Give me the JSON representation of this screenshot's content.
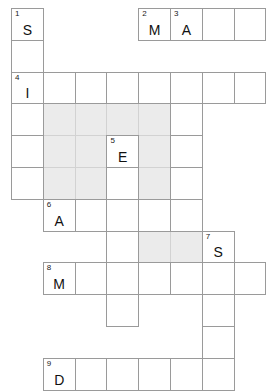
{
  "puzzle": {
    "title": "Crossword Puzzle Grid",
    "type": "crossword",
    "columns": 8,
    "rows": 12,
    "cell_size": 31.8,
    "origin_x": 11,
    "origin_y": 8,
    "colors": {
      "background": "#ffffff",
      "cell_fill": "#ffffff",
      "cell_border": "#9a9a9a",
      "shaded_fill": "#ebebeb",
      "shaded_border": "#d2d2d2",
      "number_text": "#1a1a1a",
      "letter_text": "#111111"
    },
    "cells": [
      {
        "row": 0,
        "col": 0,
        "number": "1",
        "letter": "S",
        "shaded": false
      },
      {
        "row": 0,
        "col": 4,
        "number": "2",
        "letter": "M",
        "shaded": false
      },
      {
        "row": 0,
        "col": 5,
        "number": "3",
        "letter": "A",
        "shaded": false
      },
      {
        "row": 0,
        "col": 6,
        "number": "",
        "letter": "",
        "shaded": false
      },
      {
        "row": 0,
        "col": 7,
        "number": "",
        "letter": "",
        "shaded": false
      },
      {
        "row": 1,
        "col": 0,
        "number": "",
        "letter": "",
        "shaded": false
      },
      {
        "row": 2,
        "col": 0,
        "number": "4",
        "letter": "I",
        "shaded": false
      },
      {
        "row": 2,
        "col": 1,
        "number": "",
        "letter": "",
        "shaded": false
      },
      {
        "row": 2,
        "col": 2,
        "number": "",
        "letter": "",
        "shaded": false
      },
      {
        "row": 2,
        "col": 3,
        "number": "",
        "letter": "",
        "shaded": false
      },
      {
        "row": 2,
        "col": 4,
        "number": "",
        "letter": "",
        "shaded": false
      },
      {
        "row": 2,
        "col": 5,
        "number": "",
        "letter": "",
        "shaded": false
      },
      {
        "row": 2,
        "col": 6,
        "number": "",
        "letter": "",
        "shaded": false
      },
      {
        "row": 2,
        "col": 7,
        "number": "",
        "letter": "",
        "shaded": false
      },
      {
        "row": 3,
        "col": 0,
        "number": "",
        "letter": "",
        "shaded": false
      },
      {
        "row": 3,
        "col": 1,
        "number": "",
        "letter": "",
        "shaded": true
      },
      {
        "row": 3,
        "col": 2,
        "number": "",
        "letter": "",
        "shaded": true
      },
      {
        "row": 3,
        "col": 3,
        "number": "",
        "letter": "",
        "shaded": true
      },
      {
        "row": 3,
        "col": 4,
        "number": "",
        "letter": "",
        "shaded": true
      },
      {
        "row": 3,
        "col": 5,
        "number": "",
        "letter": "",
        "shaded": false
      },
      {
        "row": 4,
        "col": 0,
        "number": "",
        "letter": "",
        "shaded": false
      },
      {
        "row": 4,
        "col": 1,
        "number": "",
        "letter": "",
        "shaded": true
      },
      {
        "row": 4,
        "col": 2,
        "number": "",
        "letter": "",
        "shaded": true
      },
      {
        "row": 4,
        "col": 3,
        "number": "5",
        "letter": "E",
        "shaded": false
      },
      {
        "row": 4,
        "col": 4,
        "number": "",
        "letter": "",
        "shaded": true
      },
      {
        "row": 4,
        "col": 5,
        "number": "",
        "letter": "",
        "shaded": false
      },
      {
        "row": 5,
        "col": 0,
        "number": "",
        "letter": "",
        "shaded": false
      },
      {
        "row": 5,
        "col": 1,
        "number": "",
        "letter": "",
        "shaded": true
      },
      {
        "row": 5,
        "col": 2,
        "number": "",
        "letter": "",
        "shaded": true
      },
      {
        "row": 5,
        "col": 3,
        "number": "",
        "letter": "",
        "shaded": false
      },
      {
        "row": 5,
        "col": 4,
        "number": "",
        "letter": "",
        "shaded": true
      },
      {
        "row": 5,
        "col": 5,
        "number": "",
        "letter": "",
        "shaded": false
      },
      {
        "row": 6,
        "col": 1,
        "number": "6",
        "letter": "A",
        "shaded": false
      },
      {
        "row": 6,
        "col": 2,
        "number": "",
        "letter": "",
        "shaded": false
      },
      {
        "row": 6,
        "col": 3,
        "number": "",
        "letter": "",
        "shaded": false
      },
      {
        "row": 6,
        "col": 4,
        "number": "",
        "letter": "",
        "shaded": false
      },
      {
        "row": 6,
        "col": 5,
        "number": "",
        "letter": "",
        "shaded": false
      },
      {
        "row": 7,
        "col": 3,
        "number": "",
        "letter": "",
        "shaded": false
      },
      {
        "row": 7,
        "col": 4,
        "number": "",
        "letter": "",
        "shaded": true
      },
      {
        "row": 7,
        "col": 5,
        "number": "",
        "letter": "",
        "shaded": true
      },
      {
        "row": 7,
        "col": 6,
        "number": "7",
        "letter": "S",
        "shaded": false
      },
      {
        "row": 8,
        "col": 1,
        "number": "8",
        "letter": "M",
        "shaded": false
      },
      {
        "row": 8,
        "col": 2,
        "number": "",
        "letter": "",
        "shaded": false
      },
      {
        "row": 8,
        "col": 3,
        "number": "",
        "letter": "",
        "shaded": false
      },
      {
        "row": 8,
        "col": 4,
        "number": "",
        "letter": "",
        "shaded": false
      },
      {
        "row": 8,
        "col": 5,
        "number": "",
        "letter": "",
        "shaded": false
      },
      {
        "row": 8,
        "col": 6,
        "number": "",
        "letter": "",
        "shaded": false
      },
      {
        "row": 8,
        "col": 7,
        "number": "",
        "letter": "",
        "shaded": false
      },
      {
        "row": 9,
        "col": 3,
        "number": "",
        "letter": "",
        "shaded": false
      },
      {
        "row": 9,
        "col": 6,
        "number": "",
        "letter": "",
        "shaded": false
      },
      {
        "row": 10,
        "col": 6,
        "number": "",
        "letter": "",
        "shaded": false
      },
      {
        "row": 11,
        "col": 1,
        "number": "9",
        "letter": "D",
        "shaded": false
      },
      {
        "row": 11,
        "col": 2,
        "number": "",
        "letter": "",
        "shaded": false
      },
      {
        "row": 11,
        "col": 3,
        "number": "",
        "letter": "",
        "shaded": false
      },
      {
        "row": 11,
        "col": 4,
        "number": "",
        "letter": "",
        "shaded": false
      },
      {
        "row": 11,
        "col": 5,
        "number": "",
        "letter": "",
        "shaded": false
      },
      {
        "row": 11,
        "col": 6,
        "number": "",
        "letter": "",
        "shaded": false
      }
    ]
  }
}
